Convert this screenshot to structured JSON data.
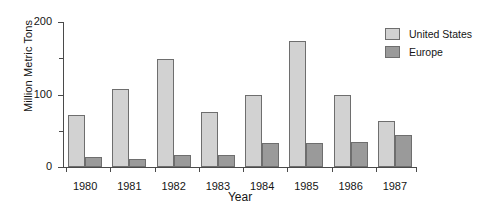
{
  "chart_data": {
    "type": "bar",
    "title": "",
    "xlabel": "Year",
    "ylabel": "Million Metric Tons",
    "categories": [
      "1980",
      "1981",
      "1982",
      "1983",
      "1984",
      "1985",
      "1986",
      "1987"
    ],
    "series": [
      {
        "name": "United States",
        "color": "#d2d2d2",
        "values": [
          72,
          108,
          149,
          76,
          99,
          174,
          100,
          63
        ]
      },
      {
        "name": "Europe",
        "color": "#9a9a9a",
        "values": [
          14,
          11,
          16,
          16,
          33,
          33,
          35,
          44
        ]
      }
    ],
    "ylim": [
      0,
      200
    ],
    "ytick_major": [
      "0",
      "100",
      "200"
    ],
    "ytick_major_values": [
      0,
      100,
      200
    ],
    "ytick_minor_values": [
      50,
      150
    ],
    "grid": false,
    "legend_position": "top-right",
    "axis_color": "#4a4a4a",
    "bar_border_color": "#6e6e6e",
    "background": "#ffffff"
  }
}
